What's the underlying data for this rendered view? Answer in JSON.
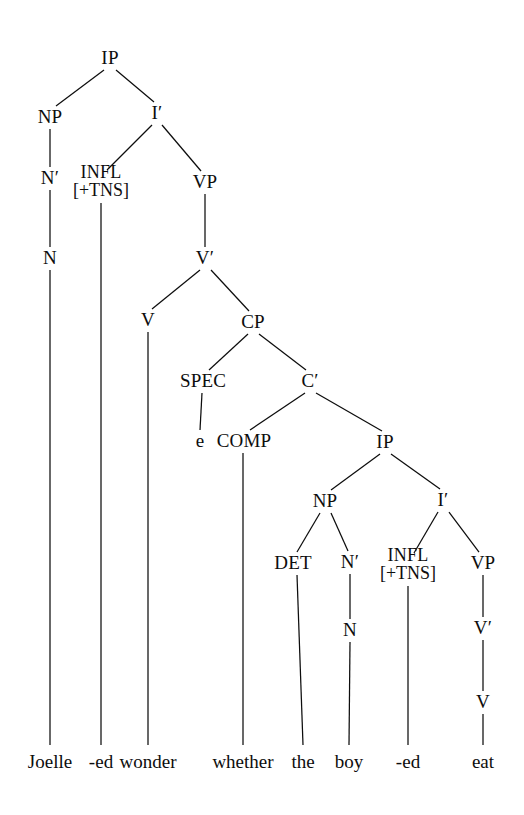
{
  "figure": {
    "title": "X-bar syntax tree for: Joelle -ed wonder whether the boy -ed eat",
    "background_color": "#ffffff",
    "ink_color": "#0d0d0d"
  },
  "nodes": [
    {
      "id": "ip1",
      "label": "IP",
      "x": 110,
      "y": 58
    },
    {
      "id": "np1",
      "label": "NP",
      "x": 50,
      "y": 117
    },
    {
      "id": "ibar1",
      "label": "I′",
      "x": 157,
      "y": 113
    },
    {
      "id": "nbar1",
      "label": "N′",
      "x": 50,
      "y": 178
    },
    {
      "id": "infl1",
      "label": "INFL",
      "feature": "[+TNS]",
      "x": 101,
      "y": 181
    },
    {
      "id": "vp1",
      "label": "VP",
      "x": 205,
      "y": 182
    },
    {
      "id": "n1",
      "label": "N",
      "x": 50,
      "y": 258
    },
    {
      "id": "vbar1",
      "label": "V′",
      "x": 205,
      "y": 258
    },
    {
      "id": "v1",
      "label": "V",
      "x": 148,
      "y": 320
    },
    {
      "id": "cp1",
      "label": "CP",
      "x": 253,
      "y": 322
    },
    {
      "id": "spec1",
      "label": "SPEC",
      "x": 203,
      "y": 381
    },
    {
      "id": "cbar1",
      "label": "C′",
      "x": 310,
      "y": 381
    },
    {
      "id": "e1",
      "label": "e",
      "x": 200,
      "y": 441
    },
    {
      "id": "comp1",
      "label": "COMP",
      "x": 244,
      "y": 441
    },
    {
      "id": "ip2",
      "label": "IP",
      "x": 385,
      "y": 442
    },
    {
      "id": "np2",
      "label": "NP",
      "x": 325,
      "y": 501
    },
    {
      "id": "ibar2",
      "label": "I′",
      "x": 443,
      "y": 500
    },
    {
      "id": "det2",
      "label": "DET",
      "x": 293,
      "y": 563
    },
    {
      "id": "nbar2",
      "label": "N′",
      "x": 350,
      "y": 562
    },
    {
      "id": "infl2",
      "label": "INFL",
      "feature": "[+TNS]",
      "x": 408,
      "y": 564
    },
    {
      "id": "vp2",
      "label": "VP",
      "x": 483,
      "y": 563
    },
    {
      "id": "n2",
      "label": "N",
      "x": 350,
      "y": 630
    },
    {
      "id": "vbar2",
      "label": "V′",
      "x": 483,
      "y": 628
    },
    {
      "id": "v2",
      "label": "V",
      "x": 483,
      "y": 702
    }
  ],
  "terminals": [
    {
      "id": "t-joelle",
      "label": "Joelle",
      "x": 50,
      "y": 762,
      "line_x": 50
    },
    {
      "id": "t-ed1",
      "label": "-ed",
      "x": 101,
      "y": 762,
      "line_x": 101
    },
    {
      "id": "t-wonder",
      "label": "wonder",
      "x": 148,
      "y": 762,
      "line_x": 148
    },
    {
      "id": "t-whether",
      "label": "whether",
      "x": 243,
      "y": 762,
      "line_x": 243
    },
    {
      "id": "t-the",
      "label": "the",
      "x": 303,
      "y": 762,
      "line_x": 303
    },
    {
      "id": "t-boy",
      "label": "boy",
      "x": 349,
      "y": 762,
      "line_x": 349
    },
    {
      "id": "t-ed2",
      "label": "-ed",
      "x": 408,
      "y": 762,
      "line_x": 408
    },
    {
      "id": "t-eat",
      "label": "eat",
      "x": 483,
      "y": 762,
      "line_x": 483
    }
  ],
  "edges": [
    {
      "from": "ip1",
      "to": "np1",
      "x1": 104,
      "y1": 70,
      "x2": 56,
      "y2": 106
    },
    {
      "from": "ip1",
      "to": "ibar1",
      "x1": 116,
      "y1": 70,
      "x2": 154,
      "y2": 102
    },
    {
      "from": "np1",
      "to": "nbar1",
      "x1": 50,
      "y1": 129,
      "x2": 50,
      "y2": 167
    },
    {
      "from": "ibar1",
      "to": "infl1",
      "x1": 152,
      "y1": 125,
      "x2": 107,
      "y2": 170
    },
    {
      "from": "ibar1",
      "to": "vp1",
      "x1": 162,
      "y1": 125,
      "x2": 201,
      "y2": 171
    },
    {
      "from": "nbar1",
      "to": "n1",
      "x1": 50,
      "y1": 190,
      "x2": 50,
      "y2": 247
    },
    {
      "from": "vp1",
      "to": "vbar1",
      "x1": 205,
      "y1": 194,
      "x2": 205,
      "y2": 247
    },
    {
      "from": "vbar1",
      "to": "v1",
      "x1": 200,
      "y1": 270,
      "x2": 152,
      "y2": 309
    },
    {
      "from": "vbar1",
      "to": "cp1",
      "x1": 211,
      "y1": 270,
      "x2": 249,
      "y2": 311
    },
    {
      "from": "cp1",
      "to": "spec1",
      "x1": 248,
      "y1": 334,
      "x2": 209,
      "y2": 370
    },
    {
      "from": "cp1",
      "to": "cbar1",
      "x1": 259,
      "y1": 334,
      "x2": 306,
      "y2": 370
    },
    {
      "from": "spec1",
      "to": "e1",
      "x1": 202,
      "y1": 393,
      "x2": 200,
      "y2": 430
    },
    {
      "from": "cbar1",
      "to": "comp1",
      "x1": 305,
      "y1": 393,
      "x2": 250,
      "y2": 430
    },
    {
      "from": "cbar1",
      "to": "ip2",
      "x1": 316,
      "y1": 393,
      "x2": 382,
      "y2": 431
    },
    {
      "from": "ip2",
      "to": "np2",
      "x1": 380,
      "y1": 454,
      "x2": 331,
      "y2": 490
    },
    {
      "from": "ip2",
      "to": "ibar2",
      "x1": 391,
      "y1": 454,
      "x2": 440,
      "y2": 489
    },
    {
      "from": "np2",
      "to": "det2",
      "x1": 320,
      "y1": 513,
      "x2": 297,
      "y2": 552
    },
    {
      "from": "np2",
      "to": "nbar2",
      "x1": 331,
      "y1": 513,
      "x2": 348,
      "y2": 551
    },
    {
      "from": "ibar2",
      "to": "infl2",
      "x1": 438,
      "y1": 512,
      "x2": 414,
      "y2": 553
    },
    {
      "from": "ibar2",
      "to": "vp2",
      "x1": 449,
      "y1": 512,
      "x2": 479,
      "y2": 552
    },
    {
      "from": "nbar2",
      "to": "n2",
      "x1": 350,
      "y1": 574,
      "x2": 350,
      "y2": 619
    },
    {
      "from": "vp2",
      "to": "vbar2",
      "x1": 483,
      "y1": 575,
      "x2": 483,
      "y2": 617
    },
    {
      "from": "vbar2",
      "to": "v2",
      "x1": 483,
      "y1": 640,
      "x2": 483,
      "y2": 691
    }
  ],
  "leaf_lines": [
    {
      "from": "n1",
      "to": "t-joelle",
      "x1": 50,
      "y1": 270,
      "x2": 50,
      "y2": 745
    },
    {
      "from": "infl1",
      "to": "t-ed1",
      "x1": 101,
      "y1": 203,
      "x2": 101,
      "y2": 745
    },
    {
      "from": "v1",
      "to": "t-wonder",
      "x1": 148,
      "y1": 332,
      "x2": 148,
      "y2": 745
    },
    {
      "from": "comp1",
      "to": "t-whether",
      "x1": 243,
      "y1": 453,
      "x2": 243,
      "y2": 745
    },
    {
      "from": "det2",
      "to": "t-the",
      "x1": 297,
      "y1": 575,
      "x2": 303,
      "y2": 745
    },
    {
      "from": "n2",
      "to": "t-boy",
      "x1": 350,
      "y1": 642,
      "x2": 349,
      "y2": 745
    },
    {
      "from": "infl2",
      "to": "t-ed2",
      "x1": 408,
      "y1": 586,
      "x2": 408,
      "y2": 745
    },
    {
      "from": "v2",
      "to": "t-eat",
      "x1": 483,
      "y1": 714,
      "x2": 483,
      "y2": 745
    }
  ]
}
